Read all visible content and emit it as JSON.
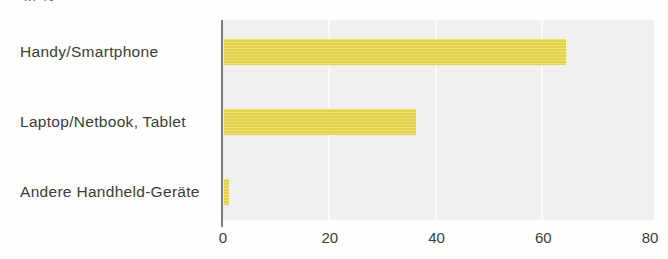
{
  "page": {
    "top_cropped_text": "in %"
  },
  "chart_data": {
    "type": "bar",
    "orientation": "horizontal",
    "title": "",
    "xlabel": "",
    "ylabel": "",
    "unit": "%",
    "categories": [
      "Handy/Smartphone",
      "Laptop/Netbook, Tablet",
      "Andere Handheld-Geräte"
    ],
    "values": [
      64,
      36,
      1
    ],
    "xlim": [
      0,
      80
    ],
    "xticks": [
      0,
      20,
      40,
      60,
      80
    ],
    "grid": "vertical white gridlines at interior ticks",
    "legend": "none",
    "colors": {
      "bar": "#e8d94c",
      "plot_background": "#f0f1ef",
      "gridline": "#fafaf8",
      "axis_line": "#7d7e7b",
      "text": "#3c3c38",
      "page_background": "#fefefd"
    }
  }
}
